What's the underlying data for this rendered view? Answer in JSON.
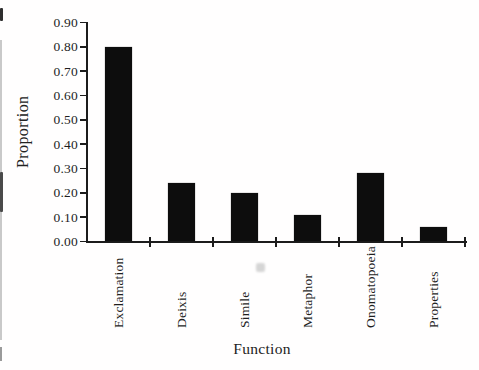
{
  "chart_data": {
    "type": "bar",
    "title": "",
    "xlabel": "Function",
    "ylabel": "Proportion",
    "categories": [
      "Exclamation",
      "Deixis",
      "Simile",
      "Metaphor",
      "Onomatopoeia",
      "Properties"
    ],
    "values": [
      0.8,
      0.24,
      0.2,
      0.11,
      0.28,
      0.06
    ],
    "ylim": [
      0.0,
      0.9
    ],
    "y_tick_step": 0.1,
    "y_tick_labels": [
      "0.00",
      "0.10",
      "0.20",
      "0.30",
      "0.40",
      "0.50",
      "0.60",
      "0.70",
      "0.80",
      "0.90"
    ],
    "grid": false,
    "legend": false,
    "bar_color": "#0d0d0d",
    "axis_color": "#1c1c1c",
    "background": "#ffffff"
  }
}
